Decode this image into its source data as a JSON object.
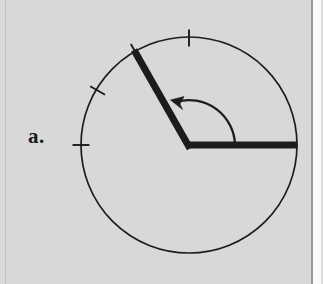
{
  "page": {
    "background_color": "#d8d8d8",
    "width": 323,
    "height": 284
  },
  "label": {
    "text": "a.",
    "color": "#1b1b1b"
  },
  "figure": {
    "name": "angle-in-circle-diagram",
    "stroke_color": "#1c1c1c",
    "circle": {
      "center_x": 189,
      "center_y": 145,
      "radius": 108,
      "stroke_width": 1.6
    },
    "rays": [
      {
        "name": "initial-side-ray",
        "angle_degrees": 0,
        "from_x": 189,
        "from_y": 145,
        "to_x": 297,
        "to_y": 145,
        "stroke_width": 7
      },
      {
        "name": "terminal-side-ray",
        "angle_degrees": 120,
        "from_x": 189,
        "from_y": 145,
        "to_x": 135,
        "to_y": 51,
        "stroke_width": 7
      }
    ],
    "arc_arrow": {
      "name": "rotation-arrow",
      "radius": 46,
      "start_angle_degrees": 0,
      "end_angle_degrees": 118,
      "direction": "counterclockwise",
      "stroke_width": 2.2,
      "arrowhead_x": 173,
      "arrowhead_y": 101
    },
    "tick_marks": [
      {
        "name": "tick-90",
        "angle_degrees": 90,
        "length": 16
      },
      {
        "name": "tick-120",
        "angle_degrees": 120,
        "length": 16
      },
      {
        "name": "tick-150",
        "angle_degrees": 150,
        "length": 16
      },
      {
        "name": "tick-180",
        "angle_degrees": 180,
        "length": 16
      }
    ]
  }
}
